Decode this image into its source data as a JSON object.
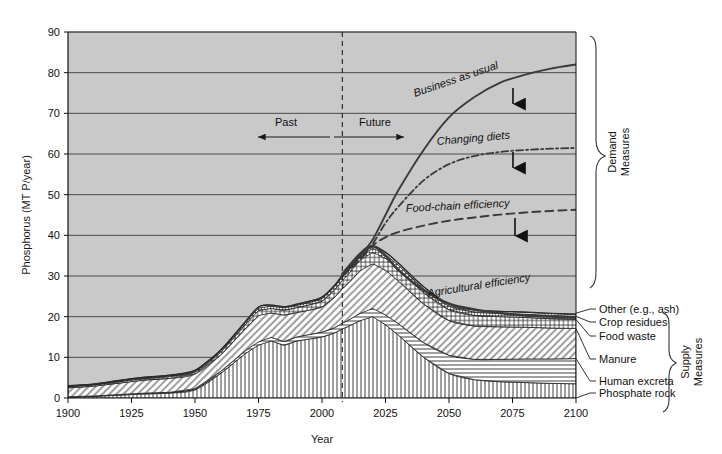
{
  "chart_data": {
    "type": "area",
    "title": "",
    "xlabel": "Year",
    "ylabel": "Phosphorus (MT P/year)",
    "xlim": [
      1900,
      2100
    ],
    "ylim": [
      0,
      90
    ],
    "xticks": [
      1900,
      1925,
      1950,
      1975,
      2000,
      2025,
      2050,
      2075,
      2100
    ],
    "yticks": [
      0,
      10,
      20,
      30,
      40,
      50,
      60,
      70,
      80,
      90
    ],
    "grid": "horizontal",
    "legend_position": "inline-annotations",
    "plot_background": "#c9c9c9",
    "divider": {
      "year": 2008,
      "style": "dashed-vertical",
      "left_label": "Past",
      "right_label": "Future"
    },
    "x": [
      1900,
      1910,
      1920,
      1930,
      1940,
      1950,
      1960,
      1970,
      1975,
      1980,
      1985,
      1990,
      1995,
      2000,
      2005,
      2008,
      2010,
      2015,
      2020,
      2025,
      2030,
      2040,
      2050,
      2060,
      2070,
      2080,
      2090,
      2100
    ],
    "stacked_supply_series": [
      {
        "name": "Phosphate rock",
        "hatch": "vertical-lines",
        "values": [
          0.2,
          0.4,
          0.7,
          1.0,
          1.2,
          2.0,
          6.0,
          11.0,
          13.0,
          14.0,
          13.0,
          14.0,
          14.5,
          15.0,
          16.0,
          17.0,
          17.5,
          19.0,
          20.0,
          18.0,
          15.5,
          10.0,
          6.0,
          4.5,
          4.0,
          3.8,
          3.6,
          3.5
        ]
      },
      {
        "name": "Human excreta",
        "hatch": "horizontal-lines",
        "values": [
          0.1,
          0.1,
          0.15,
          0.2,
          0.2,
          0.3,
          0.5,
          0.7,
          0.8,
          0.9,
          0.9,
          1.0,
          1.1,
          1.2,
          1.3,
          1.4,
          1.5,
          1.8,
          2.0,
          2.4,
          2.8,
          3.6,
          4.5,
          5.0,
          5.5,
          5.8,
          6.0,
          6.2
        ]
      },
      {
        "name": "Manure",
        "hatch": "diagonal-lines",
        "values": [
          2.2,
          2.4,
          2.8,
          3.2,
          3.4,
          3.6,
          4.0,
          5.5,
          6.5,
          6.0,
          6.5,
          6.0,
          6.0,
          6.2,
          7.5,
          8.5,
          9.0,
          10.5,
          11.0,
          11.0,
          10.5,
          9.5,
          8.5,
          8.2,
          8.0,
          7.8,
          7.6,
          7.4
        ]
      },
      {
        "name": "Food waste",
        "hatch": "cross-hatch",
        "values": [
          0.3,
          0.3,
          0.35,
          0.4,
          0.45,
          0.5,
          0.7,
          1.0,
          1.2,
          1.1,
          1.2,
          1.2,
          1.3,
          1.4,
          1.8,
          2.0,
          2.2,
          2.6,
          2.8,
          2.9,
          2.9,
          2.8,
          2.7,
          2.6,
          2.5,
          2.4,
          2.3,
          2.2
        ]
      },
      {
        "name": "Crop residues",
        "hatch": "cross-hatch-fine",
        "values": [
          0.15,
          0.15,
          0.2,
          0.2,
          0.25,
          0.3,
          0.4,
          0.5,
          0.6,
          0.6,
          0.6,
          0.6,
          0.6,
          0.7,
          0.8,
          0.9,
          0.9,
          1.0,
          1.0,
          1.0,
          1.0,
          0.95,
          0.9,
          0.85,
          0.8,
          0.8,
          0.8,
          0.8
        ]
      },
      {
        "name": "Other (e.g., ash)",
        "hatch": "dots",
        "values": [
          0.05,
          0.05,
          0.1,
          0.1,
          0.1,
          0.1,
          0.15,
          0.2,
          0.25,
          0.25,
          0.25,
          0.25,
          0.3,
          0.3,
          0.35,
          0.4,
          0.4,
          0.5,
          0.5,
          0.5,
          0.5,
          0.5,
          0.5,
          0.5,
          0.5,
          0.5,
          0.5,
          0.5
        ]
      }
    ],
    "demand_series": [
      {
        "name": "Business as usual",
        "style": "solid",
        "x": [
          2008,
          2015,
          2020,
          2025,
          2030,
          2040,
          2050,
          2060,
          2070,
          2080,
          2090,
          2100
        ],
        "values": [
          30.0,
          35.0,
          39.0,
          45.0,
          51.0,
          61.0,
          69.0,
          74.0,
          77.5,
          79.5,
          81.0,
          82.0
        ]
      },
      {
        "name": "Changing diets",
        "style": "dash-dot",
        "x": [
          2008,
          2015,
          2020,
          2025,
          2030,
          2040,
          2050,
          2060,
          2070,
          2080,
          2090,
          2100
        ],
        "values": [
          30.0,
          34.5,
          38.0,
          43.0,
          47.0,
          53.5,
          57.5,
          59.5,
          60.5,
          61.0,
          61.3,
          61.5
        ]
      },
      {
        "name": "Food-chain efficiency",
        "style": "dashed",
        "x": [
          2008,
          2015,
          2020,
          2025,
          2030,
          2040,
          2050,
          2060,
          2070,
          2080,
          2090,
          2100
        ],
        "values": [
          30.0,
          34.0,
          37.5,
          39.5,
          40.8,
          42.4,
          43.6,
          44.4,
          45.1,
          45.6,
          46.0,
          46.3
        ]
      },
      {
        "name": "Agricultural efficiency",
        "style": "solid-thick",
        "x": [
          2008,
          2015,
          2020,
          2025,
          2030,
          2040,
          2050,
          2060,
          2070,
          2080,
          2090,
          2100
        ],
        "values": [
          30.5,
          35.5,
          37.3,
          35.0,
          31.5,
          26.5,
          23.2,
          21.8,
          20.9,
          20.3,
          20.0,
          19.8
        ]
      }
    ]
  },
  "annotations": {
    "past": "Past",
    "future": "Future",
    "business_as_usual": "Business as usual",
    "changing_diets": "Changing diets",
    "food_chain_efficiency": "Food-chain efficiency",
    "agricultural_efficiency": "Agricultural efficiency"
  },
  "braces": {
    "demand": "Demand\nMeasures",
    "demand_line1": "Demand",
    "demand_line2": "Measures",
    "supply_line1": "Supply",
    "supply_line2": "Measures"
  },
  "supply_labels": [
    "Other (e.g., ash)",
    "Crop residues",
    "Food waste",
    "Manure",
    "Human excreta",
    "Phosphate rock"
  ],
  "axis": {
    "xlabel": "Year",
    "ylabel": "Phosphorus (MT P/year)",
    "xticks": [
      "1900",
      "1925",
      "1950",
      "1975",
      "2000",
      "2025",
      "2050",
      "2075",
      "2100"
    ],
    "yticks": [
      "0",
      "10",
      "20",
      "30",
      "40",
      "50",
      "60",
      "70",
      "80",
      "90"
    ]
  }
}
